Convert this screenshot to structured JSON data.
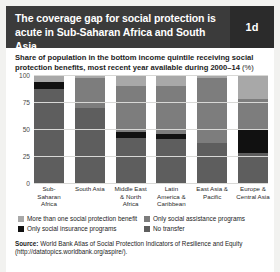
{
  "header": {
    "title": "The coverage gap for social protection is acute in Sub-Saharan Africa and South Asia",
    "badge": "1d"
  },
  "subtitle": {
    "text": "Share of population in the bottom income quintile receiving social protection benefits, most recent year available during 2000–14 ",
    "unit": "(%)"
  },
  "chart_data": {
    "type": "bar",
    "title": "The coverage gap for social protection is acute in Sub-Saharan Africa and South Asia",
    "subtitle": "Share of population in the bottom income quintile receiving social protection benefits, most recent year available during 2000–14 (%)",
    "xlabel": "",
    "ylabel": "",
    "ylim": [
      0,
      100
    ],
    "yticks": [
      "0",
      "25",
      "50",
      "75",
      "100"
    ],
    "grid": true,
    "stacked": true,
    "legend_position": "bottom",
    "categories": [
      "Sub-Saharan Africa",
      "South Asia",
      "Middle East & North Africa",
      "Latin America & Caribbean",
      "East Asia & Pacific",
      "Europe & Central Asia"
    ],
    "series": [
      {
        "name": "No transfer",
        "color": "#5e5e5e",
        "values": [
          87,
          70,
          42,
          41,
          37,
          28
        ]
      },
      {
        "name": "Only social insurance programs",
        "color": "#111111",
        "values": [
          7,
          0,
          5,
          5,
          0,
          22
        ]
      },
      {
        "name": "Only social assistance programs",
        "color": "#7d7d7d",
        "values": [
          0,
          27,
          43,
          44,
          60,
          28
        ]
      },
      {
        "name": "More than one social protection benefit",
        "color": "#a8a8a8",
        "values": [
          6,
          3,
          10,
          10,
          3,
          22
        ]
      }
    ]
  },
  "legend": [
    {
      "label": "More than one social protection benefit",
      "color": "#a8a8a8"
    },
    {
      "label": "Only social assistance programs",
      "color": "#7d7d7d"
    },
    {
      "label": "Only social insurance programs",
      "color": "#111111"
    },
    {
      "label": "No transfer",
      "color": "#5e5e5e"
    }
  ],
  "source": {
    "prefix": "Source:",
    "text": " World Bank Atlas of Social Protection Indicators of Resilience and Equity (http://datatopics.worldbank.org/aspire/)."
  }
}
